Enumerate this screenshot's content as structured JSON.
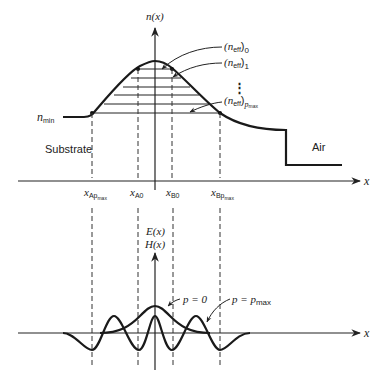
{
  "top_plot": {
    "y_axis_label": "n(x)",
    "x_axis_label": "x",
    "n_min_label": "n",
    "n_min_sub": "min",
    "region_left": "Substrate",
    "region_right": "Air",
    "mode_labels": [
      {
        "main": "(n",
        "sub": "eff",
        "close": ")",
        "index": "0"
      },
      {
        "main": "(n",
        "sub": "eff",
        "close": ")",
        "index": "1"
      },
      {
        "main": "(n",
        "sub": "eff",
        "close": ")",
        "index": "p"
      }
    ],
    "mode_index_pmax_sub": "max",
    "ellipsis": "⋮",
    "x_ticks": [
      {
        "main": "x",
        "sub": "Ap",
        "subsub": "max"
      },
      {
        "main": "x",
        "sub": "A0",
        "subsub": ""
      },
      {
        "main": "x",
        "sub": "B0",
        "subsub": ""
      },
      {
        "main": "x",
        "sub": "Bp",
        "subsub": "max"
      }
    ]
  },
  "bottom_plot": {
    "y_axis_label_1": "E(x)",
    "y_axis_label_2": "H(x)",
    "x_axis_label": "x",
    "label_p0": "p = 0",
    "label_pmax": "p = p",
    "label_pmax_sub": "max"
  }
}
